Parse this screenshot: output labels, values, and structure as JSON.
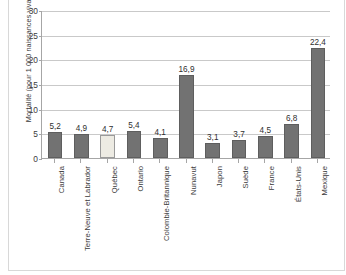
{
  "chart_data": {
    "type": "bar",
    "title": "",
    "subtitle": "",
    "xlabel": "",
    "ylabel": "Mortalité (pour 1 000 naissances vivantes)",
    "ylim": [
      0,
      30
    ],
    "yticks": [
      0,
      5,
      10,
      15,
      20,
      25,
      30
    ],
    "ytick_labels": [
      "0",
      "5",
      "10",
      "15",
      "20",
      "25",
      "30"
    ],
    "grid": true,
    "legend": null,
    "categories": [
      "Canada",
      "Terre-Neuve et Labrador",
      "Québec",
      "Ontario",
      "Colombie-Britannique",
      "Nunavut",
      "Japon",
      "Suède",
      "France",
      "États-Unis",
      "Mexique"
    ],
    "values": [
      5.2,
      4.9,
      4.7,
      5.4,
      4.1,
      16.9,
      3.1,
      3.7,
      4.5,
      6.8,
      22.4
    ],
    "value_labels": [
      "5,2",
      "4,9",
      "4,7",
      "5,4",
      "4,1",
      "16,9",
      "3,1",
      "3,7",
      "4,5",
      "6,8",
      "22,4"
    ],
    "highlight_index": 2,
    "colors": {
      "bar": "#727272",
      "bar_border": "#5e5e5e",
      "bar_highlight": "#edebe3",
      "bar_highlight_border": "#9a9a9a",
      "gridline": "#c9c9c9",
      "axis": "#a6a6a6",
      "text": "#3b3b3b",
      "background": "#ffffff"
    }
  }
}
